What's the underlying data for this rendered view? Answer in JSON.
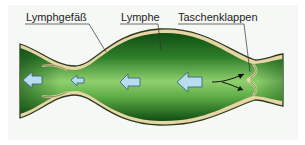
{
  "diagram": {
    "labels": [
      {
        "id": "vessel",
        "text": "Lymphgefäß"
      },
      {
        "id": "lymph",
        "text": "Lymphe"
      },
      {
        "id": "valves",
        "text": "Taschenklappen"
      }
    ],
    "flow_direction": "right-to-left",
    "arrows": [
      {
        "type": "flow",
        "size": "medium",
        "position": "left-end"
      },
      {
        "type": "flow",
        "size": "small",
        "position": "constriction"
      },
      {
        "type": "flow",
        "size": "medium",
        "position": "center"
      },
      {
        "type": "flow",
        "size": "large",
        "position": "right-bulge"
      },
      {
        "type": "pressure",
        "position": "toward-valve"
      }
    ],
    "colors": {
      "vessel_wall": "#e6d6a4",
      "wall_outline": "#2d3a20",
      "lymph_dark": "#145a18",
      "lymph_light": "#8ccf6a",
      "arrow_fill": "#b8dcf0",
      "arrow_stroke": "#3b6a7a",
      "background": "#f6f8f5"
    }
  }
}
